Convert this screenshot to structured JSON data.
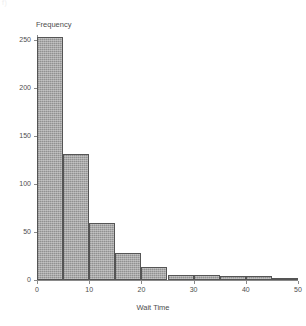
{
  "artifact_text": "f)",
  "chart_data": {
    "type": "bar",
    "title": "",
    "xlabel": "Wait Time",
    "ylabel": "Frequency",
    "xlim": [
      0,
      50
    ],
    "ylim": [
      0,
      260
    ],
    "grid": false,
    "legend": "none",
    "bin_width": 5,
    "bar_color": "#a8a8a8",
    "bar_edge_color": "#555555",
    "axis_color": "#8a8a8a",
    "x_ticks": [
      {
        "value": 0,
        "label": "0"
      },
      {
        "value": 10,
        "label": "10"
      },
      {
        "value": 20,
        "label": "20"
      },
      {
        "value": 30,
        "label": "30"
      },
      {
        "value": 40,
        "label": "40"
      },
      {
        "value": 50,
        "label": "50"
      }
    ],
    "y_ticks": [
      {
        "value": 0,
        "label": "0"
      },
      {
        "value": 50,
        "label": "50"
      },
      {
        "value": 100,
        "label": "100"
      },
      {
        "value": 150,
        "label": "150"
      },
      {
        "value": 200,
        "label": "200"
      },
      {
        "value": 250,
        "label": "250"
      }
    ],
    "categories": [
      "0-5",
      "5-10",
      "10-15",
      "15-20",
      "20-25",
      "25-30",
      "30-35",
      "35-40",
      "40-45",
      "45-50"
    ],
    "bins": [
      {
        "x0": 0,
        "x1": 5,
        "value": 253
      },
      {
        "x0": 5,
        "x1": 10,
        "value": 131
      },
      {
        "x0": 10,
        "x1": 15,
        "value": 59
      },
      {
        "x0": 15,
        "x1": 20,
        "value": 28
      },
      {
        "x0": 20,
        "x1": 25,
        "value": 14
      },
      {
        "x0": 25,
        "x1": 30,
        "value": 5
      },
      {
        "x0": 30,
        "x1": 35,
        "value": 5
      },
      {
        "x0": 35,
        "x1": 40,
        "value": 4
      },
      {
        "x0": 40,
        "x1": 45,
        "value": 4
      },
      {
        "x0": 45,
        "x1": 50,
        "value": 2
      }
    ],
    "values": [
      253,
      131,
      59,
      28,
      14,
      5,
      5,
      4,
      4,
      2
    ]
  }
}
